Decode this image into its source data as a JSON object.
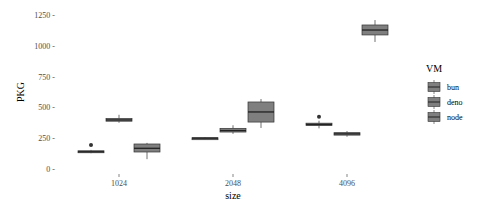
{
  "chart_data": {
    "type": "box",
    "title": "",
    "xlabel": "size",
    "ylabel": "PKG",
    "categories": [
      "1024",
      "2048",
      "4096"
    ],
    "ylim": [
      -30,
      1310
    ],
    "yticks": [
      0,
      250,
      500,
      750,
      1000,
      1250
    ],
    "ytick_labels": [
      "0 -",
      "250 -",
      "500 -",
      "750 -",
      "1000 -",
      "1250 -"
    ],
    "grid": false,
    "legend": {
      "title": "VM",
      "position": "right",
      "entries": [
        "bun",
        "deno",
        "node"
      ]
    },
    "series": [
      {
        "name": "bun",
        "boxes": [
          {
            "category": "1024",
            "whisker_low": 128,
            "q1": 135,
            "median": 140,
            "q3": 148,
            "whisker_high": 155,
            "outliers": [
              195
            ]
          },
          {
            "category": "2048",
            "whisker_low": 242,
            "q1": 246,
            "median": 250,
            "q3": 254,
            "whisker_high": 258,
            "outliers": []
          },
          {
            "category": "4096",
            "whisker_low": 330,
            "q1": 352,
            "median": 362,
            "q3": 372,
            "whisker_high": 392,
            "outliers": [
              425
            ]
          }
        ]
      },
      {
        "name": "deno",
        "boxes": [
          {
            "category": "1024",
            "whisker_low": 375,
            "q1": 388,
            "median": 398,
            "q3": 410,
            "whisker_high": 440,
            "outliers": []
          },
          {
            "category": "2048",
            "whisker_low": 285,
            "q1": 300,
            "median": 312,
            "q3": 330,
            "whisker_high": 355,
            "outliers": []
          },
          {
            "category": "4096",
            "whisker_low": 262,
            "q1": 275,
            "median": 285,
            "q3": 295,
            "whisker_high": 308,
            "outliers": []
          }
        ]
      },
      {
        "name": "node",
        "boxes": [
          {
            "category": "1024",
            "whisker_low": 80,
            "q1": 138,
            "median": 168,
            "q3": 203,
            "whisker_high": 212,
            "outliers": []
          },
          {
            "category": "2048",
            "whisker_low": 333,
            "q1": 381,
            "median": 463,
            "q3": 544,
            "whisker_high": 568,
            "outliers": []
          },
          {
            "category": "4096",
            "whisker_low": 1031,
            "q1": 1088,
            "median": 1128,
            "q3": 1169,
            "whisker_high": 1209,
            "outliers": []
          }
        ]
      }
    ]
  },
  "colors": {
    "box_fill": "#7f7f7f",
    "box_line": "#333333",
    "axis_text": "#4d4d4d"
  }
}
